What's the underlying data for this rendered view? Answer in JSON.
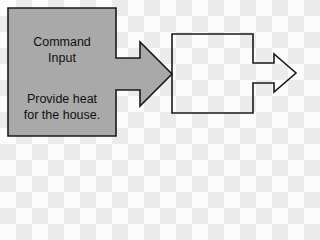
{
  "diagram": {
    "input_block": {
      "title_line1": "Command",
      "title_line2": "Input",
      "desc_line1": "Provide heat",
      "desc_line2": "for the house."
    },
    "process_block": {
      "label": ""
    },
    "colors": {
      "input_fill": "#a9a9a9",
      "stroke": "#1a1a1a",
      "output_fill": "#ffffff"
    }
  }
}
